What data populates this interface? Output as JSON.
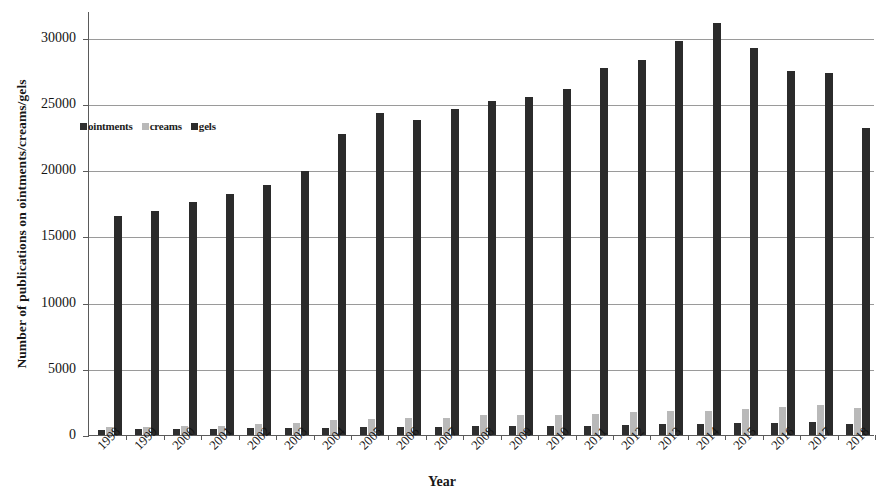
{
  "chart_data": {
    "type": "bar",
    "title": "",
    "xlabel": "Year",
    "ylabel": "Number of publications on ointments/creams/gels",
    "ylim": [
      0,
      32000
    ],
    "yticks": [
      0,
      5000,
      10000,
      15000,
      20000,
      25000,
      30000
    ],
    "ytick_labels": [
      "0",
      "5000",
      "10000",
      "15000",
      "20000",
      "25000",
      "30000"
    ],
    "grid": true,
    "legend_position": "upper-left-inside",
    "categories": [
      "1998",
      "1999",
      "2000",
      "2001",
      "2002",
      "2003",
      "2004",
      "2005",
      "2006",
      "2007",
      "2008",
      "2009",
      "2010",
      "2011",
      "2012",
      "2013",
      "2014",
      "2015",
      "2016",
      "2017",
      "2018"
    ],
    "series": [
      {
        "name": "ointments",
        "color": "#2f2f2f",
        "values": [
          380,
          420,
          450,
          470,
          520,
          560,
          540,
          600,
          640,
          620,
          660,
          680,
          660,
          700,
          760,
          800,
          820,
          880,
          920,
          980,
          860
        ]
      },
      {
        "name": "creams",
        "color": "#b9b9b9",
        "values": [
          620,
          640,
          700,
          660,
          820,
          900,
          1120,
          1220,
          1300,
          1260,
          1480,
          1540,
          1500,
          1620,
          1700,
          1800,
          1840,
          1980,
          2120,
          2240,
          2060
        ]
      },
      {
        "name": "gels",
        "color": "#2b2b2b",
        "values": [
          16500,
          16900,
          17600,
          18200,
          18900,
          19900,
          22700,
          24300,
          23800,
          24600,
          25200,
          25500,
          26100,
          27700,
          28300,
          29700,
          31100,
          29200,
          27500,
          27300,
          23200
        ]
      }
    ]
  },
  "axes": {
    "x_title": "Year",
    "y_title": "Number of publications on ointments/creams/gels"
  },
  "legend": {
    "items": [
      {
        "label": "ointments",
        "color": "#2f2f2f"
      },
      {
        "label": "creams",
        "color": "#b9b9b9"
      },
      {
        "label": "gels",
        "color": "#2b2b2b"
      }
    ]
  }
}
